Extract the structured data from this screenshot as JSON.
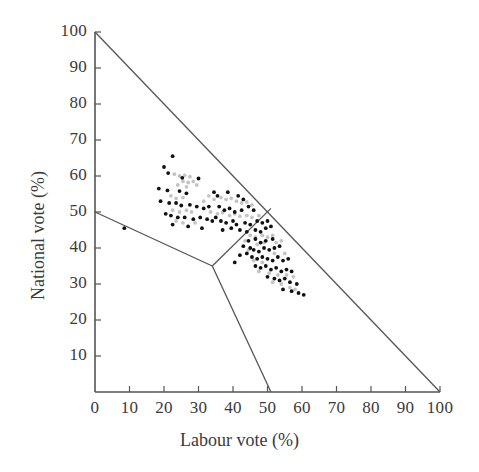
{
  "chart_data": {
    "type": "scatter",
    "title": "",
    "xlabel": "Labour vote (%)",
    "ylabel": "National vote (%)",
    "xlim": [
      0,
      100
    ],
    "ylim": [
      0,
      100
    ],
    "xticks": [
      0,
      10,
      20,
      30,
      40,
      50,
      60,
      70,
      80,
      90,
      100
    ],
    "yticks": [
      0,
      10,
      20,
      30,
      40,
      50,
      60,
      70,
      80,
      90,
      100
    ],
    "xtick_labels": [
      "0",
      "10",
      "20",
      "30",
      "40",
      "50",
      "60",
      "70",
      "80",
      "90",
      "100"
    ],
    "ytick_labels": [
      "0",
      "10",
      "20",
      "30",
      "40",
      "50",
      "60",
      "70",
      "80",
      "90",
      "100"
    ],
    "grid": false,
    "legend": "none",
    "annotations": [
      "Constraint boundary: Labour vote + National vote = 100",
      "Partition lines divide the simplex into three outcome regions meeting at a triple point near (34, 35)"
    ],
    "boundary_lines": [
      {
        "name": "simplex-hypotenuse",
        "points": [
          [
            0,
            100
          ],
          [
            100,
            0
          ]
        ]
      },
      {
        "name": "partition-left",
        "points": [
          [
            0,
            50
          ],
          [
            34,
            35
          ]
        ]
      },
      {
        "name": "partition-upper-right",
        "points": [
          [
            34,
            35
          ],
          [
            51,
            51
          ]
        ]
      },
      {
        "name": "partition-lower",
        "points": [
          [
            34,
            35
          ],
          [
            51,
            0
          ]
        ]
      }
    ],
    "series": [
      {
        "name": "dark-points",
        "color": "#111111",
        "values": [
          [
            22.5,
            65.5
          ],
          [
            20.0,
            62.5
          ],
          [
            21.2,
            60.8
          ],
          [
            25.3,
            59.5
          ],
          [
            30.0,
            59.3
          ],
          [
            18.5,
            56.5
          ],
          [
            21.0,
            56.0
          ],
          [
            24.5,
            55.8
          ],
          [
            26.5,
            55.2
          ],
          [
            34.5,
            55.5
          ],
          [
            35.5,
            54.5
          ],
          [
            38.5,
            55.5
          ],
          [
            41.5,
            54.5
          ],
          [
            43.0,
            53.5
          ],
          [
            19.0,
            53.0
          ],
          [
            21.5,
            52.5
          ],
          [
            23.5,
            52.5
          ],
          [
            25.0,
            51.8
          ],
          [
            27.5,
            52.0
          ],
          [
            29.5,
            51.5
          ],
          [
            31.5,
            51.0
          ],
          [
            33.0,
            51.5
          ],
          [
            36.0,
            51.5
          ],
          [
            37.5,
            50.5
          ],
          [
            39.0,
            51.0
          ],
          [
            40.5,
            50.0
          ],
          [
            42.5,
            50.5
          ],
          [
            44.5,
            51.5
          ],
          [
            46.0,
            50.5
          ],
          [
            20.5,
            49.5
          ],
          [
            22.0,
            49.0
          ],
          [
            24.0,
            48.5
          ],
          [
            26.0,
            48.5
          ],
          [
            28.5,
            48.0
          ],
          [
            30.5,
            48.5
          ],
          [
            32.5,
            48.0
          ],
          [
            34.0,
            47.5
          ],
          [
            35.0,
            48.5
          ],
          [
            36.5,
            47.5
          ],
          [
            38.0,
            47.0
          ],
          [
            40.0,
            47.5
          ],
          [
            41.0,
            46.5
          ],
          [
            43.5,
            47.0
          ],
          [
            45.0,
            46.5
          ],
          [
            47.0,
            47.5
          ],
          [
            48.5,
            47.0
          ],
          [
            50.0,
            47.5
          ],
          [
            22.5,
            46.5
          ],
          [
            27.0,
            46.0
          ],
          [
            31.0,
            45.5
          ],
          [
            37.0,
            45.0
          ],
          [
            39.5,
            45.5
          ],
          [
            42.0,
            45.0
          ],
          [
            44.0,
            44.5
          ],
          [
            46.5,
            45.0
          ],
          [
            48.0,
            44.5
          ],
          [
            49.5,
            45.5
          ],
          [
            51.0,
            46.0
          ],
          [
            8.5,
            45.5
          ],
          [
            44.5,
            42.0
          ],
          [
            46.5,
            42.5
          ],
          [
            48.0,
            41.5
          ],
          [
            49.5,
            42.0
          ],
          [
            51.5,
            42.5
          ],
          [
            43.0,
            40.5
          ],
          [
            45.0,
            40.0
          ],
          [
            46.0,
            39.5
          ],
          [
            47.5,
            39.0
          ],
          [
            49.0,
            40.0
          ],
          [
            50.5,
            39.5
          ],
          [
            52.0,
            40.0
          ],
          [
            53.5,
            40.5
          ],
          [
            42.0,
            38.0
          ],
          [
            44.0,
            38.5
          ],
          [
            45.5,
            37.5
          ],
          [
            47.0,
            37.0
          ],
          [
            48.5,
            37.5
          ],
          [
            50.0,
            37.0
          ],
          [
            51.5,
            36.5
          ],
          [
            53.0,
            37.5
          ],
          [
            54.5,
            36.5
          ],
          [
            56.0,
            37.0
          ],
          [
            40.5,
            36.0
          ],
          [
            46.5,
            35.0
          ],
          [
            48.0,
            34.5
          ],
          [
            49.5,
            35.0
          ],
          [
            51.0,
            34.0
          ],
          [
            52.5,
            34.5
          ],
          [
            54.0,
            33.5
          ],
          [
            55.5,
            34.0
          ],
          [
            57.0,
            33.5
          ],
          [
            50.0,
            32.0
          ],
          [
            52.0,
            31.5
          ],
          [
            53.5,
            31.0
          ],
          [
            55.0,
            31.5
          ],
          [
            56.5,
            30.5
          ],
          [
            58.5,
            30.0
          ],
          [
            54.5,
            28.5
          ],
          [
            57.0,
            28.0
          ],
          [
            59.0,
            27.5
          ],
          [
            60.5,
            27.0
          ]
        ]
      },
      {
        "name": "light-points",
        "color": "#c4c4c4",
        "values": [
          [
            23.0,
            60.5
          ],
          [
            24.5,
            60.0
          ],
          [
            26.0,
            60.2
          ],
          [
            27.5,
            59.8
          ],
          [
            25.5,
            58.5
          ],
          [
            27.0,
            58.2
          ],
          [
            28.5,
            58.5
          ],
          [
            24.0,
            57.5
          ],
          [
            26.5,
            57.0
          ],
          [
            29.5,
            57.5
          ],
          [
            22.0,
            54.5
          ],
          [
            23.5,
            53.8
          ],
          [
            25.5,
            54.0
          ],
          [
            33.0,
            54.5
          ],
          [
            34.5,
            53.5
          ],
          [
            36.5,
            54.0
          ],
          [
            38.0,
            53.5
          ],
          [
            39.5,
            53.8
          ],
          [
            41.0,
            53.0
          ],
          [
            42.5,
            52.5
          ],
          [
            44.0,
            52.8
          ],
          [
            45.5,
            52.0
          ],
          [
            31.5,
            53.0
          ],
          [
            22.5,
            50.5
          ],
          [
            24.5,
            50.0
          ],
          [
            26.5,
            50.5
          ],
          [
            28.0,
            50.0
          ],
          [
            33.5,
            50.0
          ],
          [
            35.5,
            49.5
          ],
          [
            37.0,
            49.8
          ],
          [
            39.0,
            49.0
          ],
          [
            40.5,
            49.5
          ],
          [
            42.0,
            48.8
          ],
          [
            44.0,
            49.0
          ],
          [
            45.5,
            48.5
          ],
          [
            47.5,
            49.0
          ],
          [
            23.5,
            47.5
          ],
          [
            25.5,
            47.0
          ],
          [
            29.0,
            47.0
          ],
          [
            45.0,
            43.5
          ],
          [
            46.5,
            43.0
          ],
          [
            48.5,
            43.5
          ],
          [
            50.0,
            43.0
          ],
          [
            51.5,
            43.5
          ],
          [
            43.5,
            42.0
          ],
          [
            47.0,
            41.0
          ],
          [
            49.0,
            41.5
          ],
          [
            52.5,
            41.5
          ],
          [
            54.0,
            42.0
          ],
          [
            44.5,
            39.5
          ],
          [
            46.0,
            36.5
          ],
          [
            48.5,
            36.0
          ],
          [
            52.0,
            38.5
          ],
          [
            55.0,
            38.5
          ],
          [
            47.5,
            33.5
          ],
          [
            50.5,
            33.0
          ],
          [
            53.0,
            32.5
          ],
          [
            55.5,
            32.5
          ],
          [
            57.5,
            32.0
          ],
          [
            51.5,
            30.5
          ],
          [
            54.0,
            30.0
          ],
          [
            56.5,
            29.0
          ],
          [
            58.0,
            28.5
          ]
        ]
      }
    ]
  },
  "axis": {
    "xlabel": "Labour vote (%)",
    "ylabel": "National vote (%)",
    "line_color": "#555555"
  }
}
